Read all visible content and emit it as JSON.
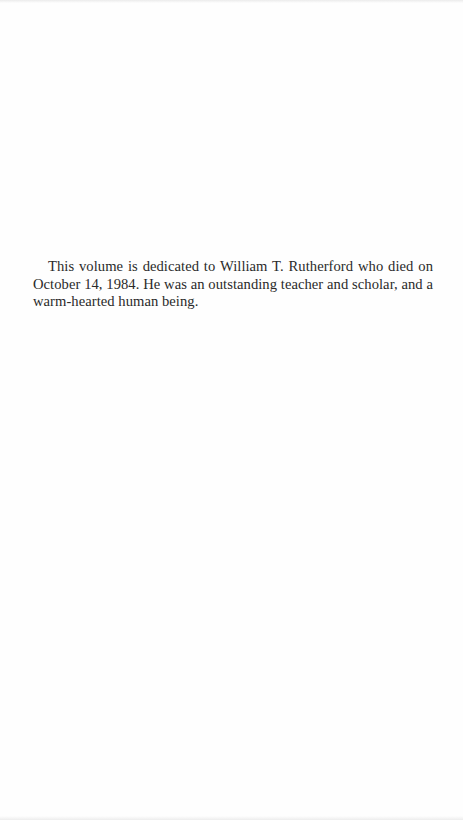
{
  "page": {
    "type": "dedication",
    "background_color": "#fefefe",
    "text_color": "#2a2a2a"
  },
  "dedication": {
    "text": "This volume is dedicated to William T. Rutherford who died on October 14, 1984. He was an outstanding teacher and scholar, and a warm-hearted human being."
  }
}
